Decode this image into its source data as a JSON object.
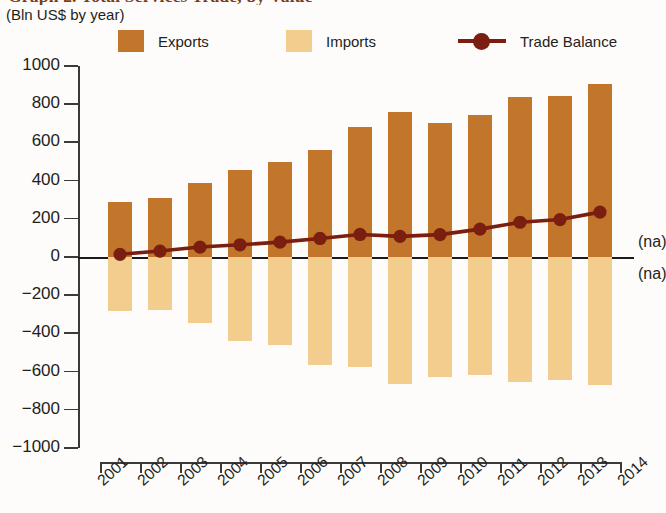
{
  "title": "Graph 2. Total Services Trade, by Value",
  "subtitle": "(Bln US$ by year)",
  "legend": {
    "exports": "Exports",
    "imports": "Imports",
    "balance": "Trade Balance"
  },
  "annotations": {
    "na_top": "(na)",
    "na_bottom": "(na)"
  },
  "colors": {
    "exports": "#c1762c",
    "imports": "#f3cd8e",
    "balance": "#7b1d0f",
    "axis": "#3a3a3a",
    "title": "#7a3b16"
  },
  "chart_data": {
    "type": "bar",
    "title": "Graph 2. Total Services Trade, by Value",
    "subtitle": "(Bln US$ by year)",
    "xlabel": "",
    "ylabel": "Bln US$",
    "ylim": [
      -1000,
      1000
    ],
    "ytick_labels": [
      "1000",
      "800",
      "600",
      "400",
      "200",
      "0",
      "-200",
      "-400",
      "-600",
      "-800",
      "-1000"
    ],
    "ytick_values": [
      1000,
      800,
      600,
      400,
      200,
      0,
      -200,
      -400,
      -600,
      -800,
      -1000
    ],
    "grid": false,
    "legend_position": "top",
    "categories": [
      "2001",
      "2002",
      "2003",
      "2004",
      "2005",
      "2006",
      "2007",
      "2008",
      "2009",
      "2010",
      "2011",
      "2012",
      "2013",
      "2014"
    ],
    "xtick_labels": [
      "2001",
      "2002",
      "2003",
      "2004",
      "2005",
      "2006",
      "2007",
      "2008",
      "2009",
      "2010",
      "2011",
      "2012",
      "2013",
      "2014"
    ],
    "series": [
      {
        "name": "Exports",
        "type": "bar",
        "color": "#c1762c",
        "values": [
          290,
          310,
          385,
          455,
          500,
          560,
          680,
          760,
          700,
          745,
          840,
          845,
          905,
          null
        ]
      },
      {
        "name": "Imports",
        "type": "bar",
        "color": "#f3cd8e",
        "values": [
          -283,
          -276,
          -345,
          -440,
          -460,
          -565,
          -575,
          -665,
          -630,
          -620,
          -655,
          -645,
          -670,
          null
        ]
      },
      {
        "name": "Trade Balance",
        "type": "line",
        "color": "#7b1d0f",
        "values": [
          14,
          31,
          52,
          64,
          78,
          97,
          118,
          108,
          117,
          146,
          182,
          196,
          235,
          null
        ]
      }
    ]
  }
}
